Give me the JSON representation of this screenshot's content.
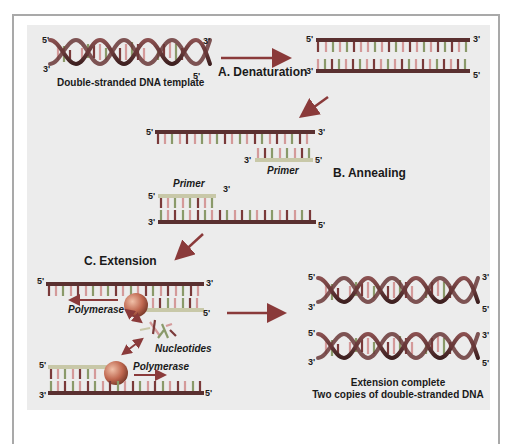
{
  "diagram": {
    "colors": {
      "background_panel": "#ececec",
      "frame_border": "#a9a9a9",
      "strand_dark": "#5a3030",
      "strand_primer": "#c8c8a8",
      "base_a": "#7a3a3a",
      "base_b": "#d49a9a",
      "base_c": "#8a9a6a",
      "polymerase": "#c0705a",
      "arrow": "#8a3a3a"
    },
    "template": {
      "caption": "Double-stranded DNA template",
      "end_top_left": "5'",
      "end_bottom_left": "3'",
      "end_top_right": "3'",
      "end_bottom_right": "5'"
    },
    "steps": {
      "denaturation": {
        "label": "A. Denaturation",
        "top_left": "5'",
        "top_right": "3'",
        "bottom_left": "3'",
        "bottom_right": "5'"
      },
      "annealing": {
        "label": "B. Annealing",
        "upper": {
          "left": "5'",
          "right": "3'",
          "primer_left": "3'",
          "primer_right": "5'",
          "primer_label": "Primer"
        },
        "lower": {
          "primer_left": "5'",
          "primer_right": "3'",
          "primer_label": "Primer",
          "left": "3'",
          "right": "5'"
        }
      },
      "extension": {
        "label": "C. Extension",
        "upper": {
          "left": "5'",
          "right": "3'",
          "primer_right": "5'",
          "enzyme_label": "Polymerase"
        },
        "nucleotides_label": "Nucleotides",
        "lower": {
          "primer_left": "5'",
          "left": "3'",
          "right": "5'",
          "enzyme_label": "Polymerase"
        }
      },
      "complete": {
        "caption_line1": "Extension complete",
        "caption_line2": "Two copies of double-stranded DNA",
        "helix1": {
          "top_left": "5'",
          "bottom_left": "3'",
          "top_right": "3'",
          "bottom_right": "5'"
        },
        "helix2": {
          "top_left": "5'",
          "bottom_left": "3'",
          "top_right": "3'",
          "bottom_right": "5'"
        }
      }
    }
  }
}
